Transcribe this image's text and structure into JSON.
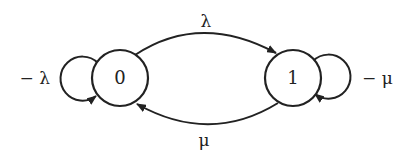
{
  "diagram": {
    "type": "state-transition",
    "states": [
      {
        "id": "0",
        "label": "0"
      },
      {
        "id": "1",
        "label": "1"
      }
    ],
    "transitions": [
      {
        "from": "0",
        "to": "1",
        "label": "λ"
      },
      {
        "from": "1",
        "to": "0",
        "label": "μ"
      },
      {
        "from": "0",
        "to": "0",
        "label": "− λ"
      },
      {
        "from": "1",
        "to": "1",
        "label": "− μ"
      }
    ],
    "colors": {
      "stroke": "#222222",
      "background": "#ffffff"
    }
  }
}
